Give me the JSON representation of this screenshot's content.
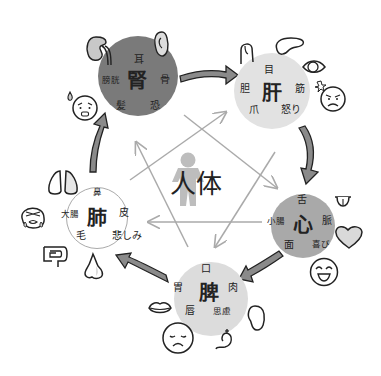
{
  "center": {
    "label": "人体",
    "icon": "human-figure-icon"
  },
  "organs": {
    "kidney": {
      "name": "腎",
      "color": "#7a7a7a",
      "labels": {
        "top": "耳",
        "left": "膀胱",
        "right": "骨",
        "bottom_left": "髪",
        "bottom_right": "恐"
      },
      "icons": [
        "kidney-icon",
        "ear-icon",
        "anxious-face-icon"
      ]
    },
    "liver": {
      "name": "肝",
      "color": "#e2e2e2",
      "labels": {
        "top": "目",
        "left": "胆",
        "right": "筋",
        "bottom_left": "爪",
        "bottom_right": "怒り"
      },
      "icons": [
        "fingernail-icon",
        "liver-icon",
        "eye-icon",
        "angry-face-icon"
      ]
    },
    "heart": {
      "name": "心",
      "color": "#a9a9a9",
      "labels": {
        "top": "舌",
        "left": "小腸",
        "right": "脈",
        "bottom_left": "面",
        "bottom_right": "喜び"
      },
      "icons": [
        "tongue-icon",
        "heart-icon",
        "laughing-face-icon"
      ]
    },
    "spleen": {
      "name": "脾",
      "color": "#dcdcdc",
      "labels": {
        "top": "口",
        "left": "胃",
        "right": "肉",
        "bottom_left": "唇",
        "bottom_right": "思慮"
      },
      "icons": [
        "lips-icon",
        "sad-face-icon",
        "stomach-icon",
        "bean-icon"
      ]
    },
    "lung": {
      "name": "肺",
      "color": "#ffffff",
      "labels": {
        "top": "鼻",
        "left": "大腸",
        "right": "皮",
        "bottom_left": "毛",
        "bottom_right": "悲しみ"
      },
      "icons": [
        "lungs-icon",
        "crying-face-icon",
        "large-intestine-icon",
        "nose-icon"
      ]
    }
  },
  "cycle_arrows": [
    "kidney-to-liver",
    "liver-to-heart",
    "heart-to-spleen",
    "spleen-to-lung",
    "lung-to-kidney"
  ],
  "colors": {
    "arrow_fill": "#8a8a8a",
    "star_line": "#aaaaaa",
    "stroke": "#222222"
  }
}
